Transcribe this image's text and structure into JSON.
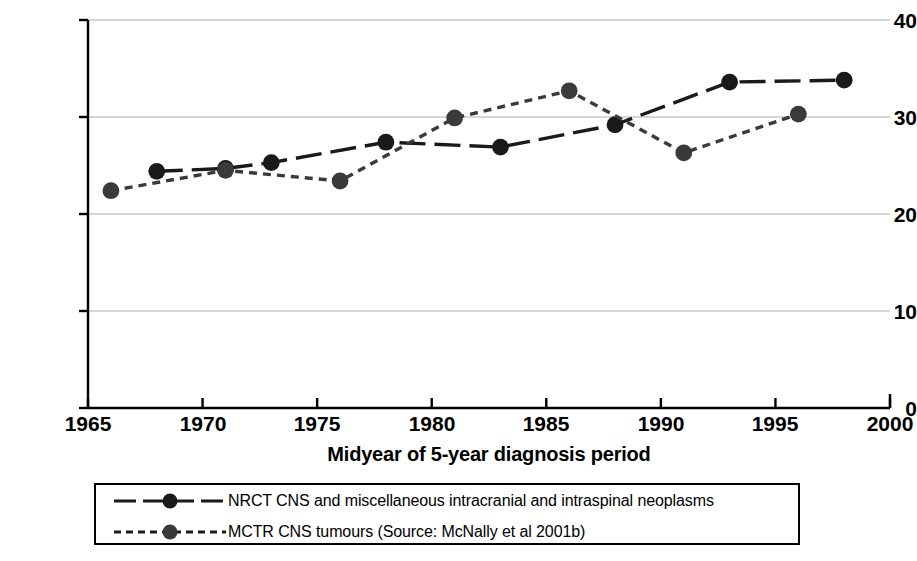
{
  "chart_data": {
    "type": "line",
    "title": "",
    "xlabel": "Midyear of 5-year diagnosis period",
    "ylabel": "ASR (world) per million child-years",
    "xlim": [
      1965,
      2000
    ],
    "ylim": [
      0,
      40
    ],
    "xticks": [
      1965,
      1970,
      1975,
      1980,
      1985,
      1990,
      1995,
      2000
    ],
    "yticks": [
      0,
      10,
      20,
      30,
      40
    ],
    "grid": "horizontal",
    "legend_position": "below-axes",
    "series": [
      {
        "name": "NRCT CNS and miscellaneous intracranial and intraspinal neoplasms",
        "style": "dashed-long",
        "marker": "filled-circle",
        "color": "#1a1a1a",
        "x": [
          1968,
          1971,
          1973,
          1978,
          1983,
          1988,
          1993,
          1998
        ],
        "y": [
          24.4,
          24.7,
          25.3,
          27.4,
          26.9,
          29.2,
          33.6,
          33.8
        ]
      },
      {
        "name": "MCTR CNS tumours (Source: McNally et al 2001b)",
        "style": "dotted-short",
        "marker": "filled-circle",
        "color": "#3a3a3a",
        "x": [
          1966,
          1971,
          1976,
          1981,
          1986,
          1991,
          1996
        ],
        "y": [
          22.4,
          24.5,
          23.4,
          29.9,
          32.7,
          26.3,
          30.3
        ]
      }
    ]
  },
  "axis": {
    "ytick_labels": [
      "40",
      "30",
      "20",
      "10",
      "0"
    ],
    "xtick_labels": [
      "1965",
      "1970",
      "1975",
      "1980",
      "1985",
      "1990",
      "1995",
      "2000"
    ],
    "ylabel": "ASR (world) per million child-years",
    "xlabel": "Midyear of 5-year diagnosis period"
  },
  "legend": {
    "entries": [
      {
        "label": "NRCT CNS and miscellaneous intracranial and intraspinal neoplasms"
      },
      {
        "label": "MCTR CNS tumours (Source: McNally et al 2001b)"
      }
    ]
  },
  "colors": {
    "series_nrct": "#1a1a1a",
    "series_mctr": "#3a3a3a",
    "grid": "#c9c9c9",
    "axis": "#000000",
    "background": "#ffffff"
  }
}
